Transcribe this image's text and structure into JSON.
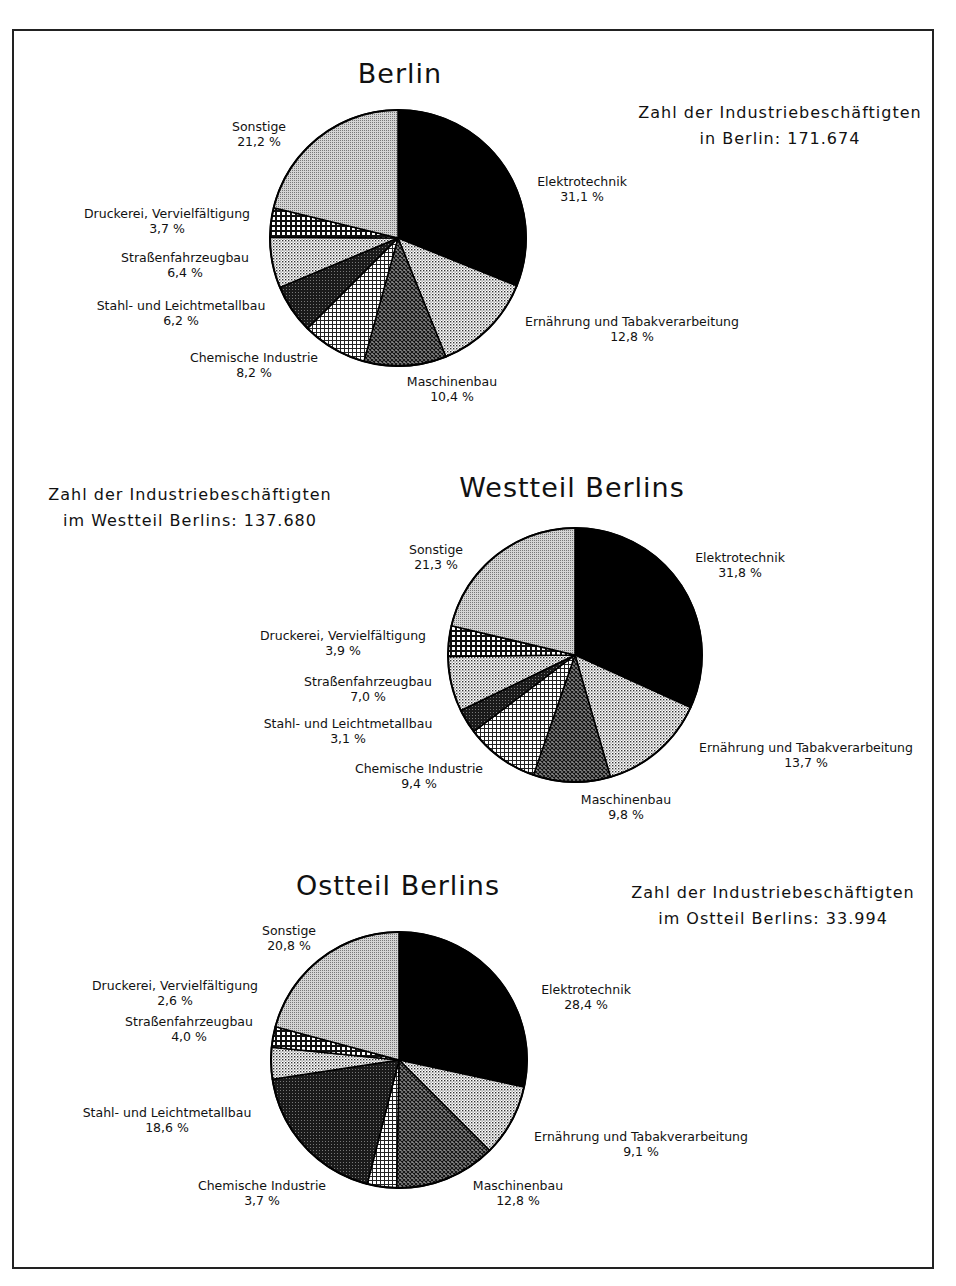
{
  "chart_data": [
    {
      "type": "pie",
      "title": "Berlin",
      "total_label_line1": "Zahl der Industriebeschäftigten",
      "total_label_line2": "in Berlin: 171.674",
      "center": [
        398,
        238
      ],
      "radius": 128,
      "title_pos": [
        400,
        74
      ],
      "total_pos": [
        780,
        128
      ],
      "slices": [
        {
          "label": "Elektrotechnik",
          "value": 31.1,
          "value_text": "31,1 %",
          "pattern": "black",
          "label_pos": [
            582,
            182
          ]
        },
        {
          "label": "Ernährung und Tabakverarbeitung",
          "value": 12.8,
          "value_text": "12,8 %",
          "pattern": "dots",
          "label_pos": [
            632,
            322
          ]
        },
        {
          "label": "Maschinenbau",
          "value": 10.4,
          "value_text": "10,4 %",
          "pattern": "crossdark",
          "label_pos": [
            452,
            382
          ]
        },
        {
          "label": "Chemische Industrie",
          "value": 8.2,
          "value_text": "8,2 %",
          "pattern": "grid",
          "label_pos": [
            254,
            358
          ]
        },
        {
          "label": "Stahl- und Leichtmetallbau",
          "value": 6.2,
          "value_text": "6,2 %",
          "pattern": "dark",
          "label_pos": [
            181,
            306
          ]
        },
        {
          "label": "Straßenfahrzeugbau",
          "value": 6.4,
          "value_text": "6,4 %",
          "pattern": "dots",
          "label_pos": [
            185,
            258
          ]
        },
        {
          "label": "Druckerei, Vervielfältigung",
          "value": 3.7,
          "value_text": "3,7 %",
          "pattern": "gridbold",
          "label_pos": [
            167,
            214
          ]
        },
        {
          "label": "Sonstige",
          "value": 21.2,
          "value_text": "21,2 %",
          "pattern": "gray",
          "label_pos": [
            259,
            127
          ]
        }
      ]
    },
    {
      "type": "pie",
      "title": "Westteil Berlins",
      "total_label_line1": "Zahl der Industriebeschäftigten",
      "total_label_line2": "im Westteil Berlins: 137.680",
      "center": [
        575,
        655
      ],
      "radius": 127,
      "title_pos": [
        572,
        488
      ],
      "total_pos": [
        190,
        510
      ],
      "slices": [
        {
          "label": "Elektrotechnik",
          "value": 31.8,
          "value_text": "31,8 %",
          "pattern": "black",
          "label_pos": [
            740,
            558
          ]
        },
        {
          "label": "Ernährung und Tabakverarbeitung",
          "value": 13.7,
          "value_text": "13,7 %",
          "pattern": "dots",
          "label_pos": [
            806,
            748
          ]
        },
        {
          "label": "Maschinenbau",
          "value": 9.8,
          "value_text": "9,8 %",
          "pattern": "crossdark",
          "label_pos": [
            626,
            800
          ]
        },
        {
          "label": "Chemische Industrie",
          "value": 9.4,
          "value_text": "9,4 %",
          "pattern": "grid",
          "label_pos": [
            419,
            769
          ]
        },
        {
          "label": "Stahl- und Leichtmetallbau",
          "value": 3.1,
          "value_text": "3,1 %",
          "pattern": "dark",
          "label_pos": [
            348,
            724
          ]
        },
        {
          "label": "Straßenfahrzeugbau",
          "value": 7.0,
          "value_text": "7,0 %",
          "pattern": "dots",
          "label_pos": [
            368,
            682
          ]
        },
        {
          "label": "Druckerei, Vervielfältigung",
          "value": 3.9,
          "value_text": "3,9 %",
          "pattern": "gridbold",
          "label_pos": [
            343,
            636
          ]
        },
        {
          "label": "Sonstige",
          "value": 21.3,
          "value_text": "21,3 %",
          "pattern": "gray",
          "label_pos": [
            436,
            550
          ]
        }
      ]
    },
    {
      "type": "pie",
      "title": "Ostteil Berlins",
      "total_label_line1": "Zahl der Industriebeschäftigten",
      "total_label_line2": "im Ostteil Berlins: 33.994",
      "center": [
        399,
        1060
      ],
      "radius": 128,
      "title_pos": [
        398,
        886
      ],
      "total_pos": [
        773,
        908
      ],
      "slices": [
        {
          "label": "Elektrotechnik",
          "value": 28.4,
          "value_text": "28,4 %",
          "pattern": "black",
          "label_pos": [
            586,
            990
          ]
        },
        {
          "label": "Ernährung und Tabakverarbeitung",
          "value": 9.1,
          "value_text": "9,1 %",
          "pattern": "dots",
          "label_pos": [
            641,
            1137
          ]
        },
        {
          "label": "Maschinenbau",
          "value": 12.8,
          "value_text": "12,8 %",
          "pattern": "crossdark",
          "label_pos": [
            518,
            1186
          ]
        },
        {
          "label": "Chemische Industrie",
          "value": 3.7,
          "value_text": "3,7 %",
          "pattern": "grid",
          "label_pos": [
            262,
            1186
          ]
        },
        {
          "label": "Stahl- und Leichtmetallbau",
          "value": 18.6,
          "value_text": "18,6 %",
          "pattern": "dark",
          "label_pos": [
            167,
            1113
          ]
        },
        {
          "label": "Straßenfahrzeugbau",
          "value": 4.0,
          "value_text": "4,0 %",
          "pattern": "dots",
          "label_pos": [
            189,
            1022
          ]
        },
        {
          "label": "Druckerei, Vervielfältigung",
          "value": 2.6,
          "value_text": "2,6 %",
          "pattern": "gridbold",
          "label_pos": [
            175,
            986
          ]
        },
        {
          "label": "Sonstige",
          "value": 20.8,
          "value_text": "20,8 %",
          "pattern": "gray",
          "label_pos": [
            289,
            931
          ]
        }
      ]
    }
  ]
}
